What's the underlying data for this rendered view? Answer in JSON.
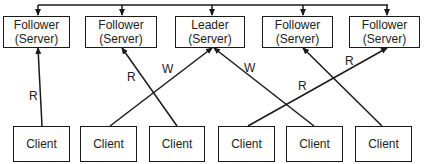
{
  "diagram": {
    "servers": [
      {
        "role": "Follower",
        "type": "(Server)",
        "x": 3,
        "w": 67
      },
      {
        "role": "Follower",
        "type": "(Server)",
        "x": 85,
        "w": 72
      },
      {
        "role": "Leader",
        "type": "(Server)",
        "x": 175,
        "w": 70
      },
      {
        "role": "Follower",
        "type": "(Server)",
        "x": 262,
        "w": 71
      },
      {
        "role": "Follower",
        "type": "(Server)",
        "x": 349,
        "w": 71
      }
    ],
    "clients": [
      {
        "label": "Client",
        "x": 13,
        "w": 57
      },
      {
        "label": "Client",
        "x": 80,
        "w": 57
      },
      {
        "label": "Client",
        "x": 149,
        "w": 56
      },
      {
        "label": "Client",
        "x": 218,
        "w": 57
      },
      {
        "label": "Client",
        "x": 286,
        "w": 57
      },
      {
        "label": "Client",
        "x": 355,
        "w": 57
      }
    ],
    "connections": [
      {
        "from": "client-1",
        "to": "server-1",
        "op": "R",
        "x1": 42,
        "y1": 126,
        "x2": 38,
        "y2": 48,
        "lx": 29,
        "ly": 89
      },
      {
        "from": "client-3",
        "to": "server-2",
        "op": "R",
        "x1": 177,
        "y1": 126,
        "x2": 122,
        "y2": 48,
        "lx": 127,
        "ly": 70
      },
      {
        "from": "client-2",
        "to": "server-3",
        "op": "W",
        "x1": 110,
        "y1": 126,
        "x2": 212,
        "y2": 48,
        "lx": 162,
        "ly": 62
      },
      {
        "from": "client-5",
        "to": "server-3",
        "op": "W",
        "x1": 314,
        "y1": 126,
        "x2": 214,
        "y2": 48,
        "lx": 244,
        "ly": 61
      },
      {
        "from": "client-4",
        "to": "server-5",
        "op": "R",
        "x1": 248,
        "y1": 126,
        "x2": 387,
        "y2": 48,
        "lx": 345,
        "ly": 54
      },
      {
        "from": "client-6",
        "to": "server-4",
        "op": "R",
        "x1": 382,
        "y1": 126,
        "x2": 303,
        "y2": 48,
        "lx": 298,
        "ly": 79
      }
    ],
    "replication_bus": {
      "y": 5,
      "x_start": 38,
      "x_end": 388,
      "drops": [
        38,
        122,
        212,
        303,
        387
      ]
    },
    "colors": {
      "stroke": "#1a1a1a",
      "text": "#222222",
      "background": "#ffffff"
    }
  }
}
